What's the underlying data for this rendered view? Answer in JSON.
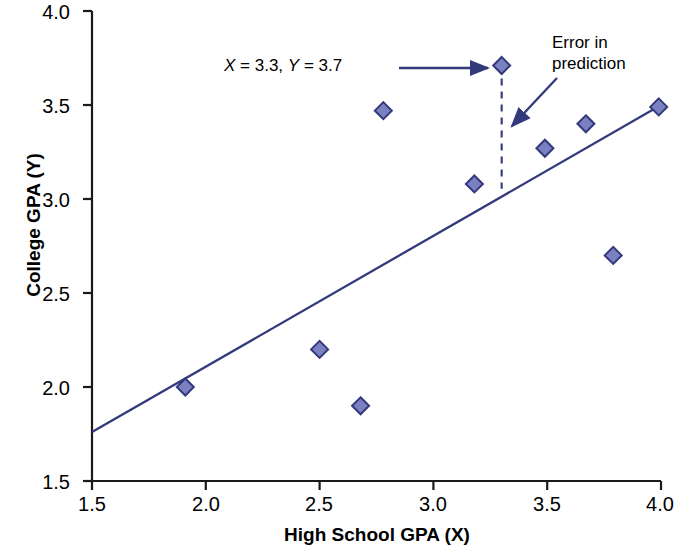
{
  "chart_data": {
    "type": "scatter",
    "title": "",
    "xlabel": "High School GPA (X)",
    "ylabel": "College GPA (Y)",
    "xlim": [
      1.5,
      4.0
    ],
    "ylim": [
      1.5,
      4.0
    ],
    "xticks": [
      "1.5",
      "2.0",
      "2.5",
      "3.0",
      "3.5",
      "4.0"
    ],
    "xtick_values": [
      1.5,
      2.0,
      2.5,
      3.0,
      3.5,
      4.0
    ],
    "yticks": [
      "1.5",
      "2.0",
      "2.5",
      "3.0",
      "3.5",
      "4.0"
    ],
    "ytick_values": [
      1.5,
      2.0,
      2.5,
      3.0,
      3.5,
      4.0
    ],
    "grid": false,
    "legend": false,
    "series": [
      {
        "name": "Students",
        "marker": "diamond",
        "marker_fill": "#7b80c0",
        "marker_edge": "#333a7c",
        "points": [
          {
            "x": 1.91,
            "y": 2.0
          },
          {
            "x": 2.5,
            "y": 2.2
          },
          {
            "x": 2.68,
            "y": 1.9
          },
          {
            "x": 2.78,
            "y": 3.47
          },
          {
            "x": 3.18,
            "y": 3.08
          },
          {
            "x": 3.3,
            "y": 3.71
          },
          {
            "x": 3.49,
            "y": 3.27
          },
          {
            "x": 3.67,
            "y": 3.4
          },
          {
            "x": 3.79,
            "y": 2.7
          },
          {
            "x": 3.99,
            "y": 3.49
          }
        ]
      }
    ],
    "regression_line": {
      "name": "Regression line",
      "color": "#333a7c",
      "x0": 1.5,
      "y0": 1.76,
      "x1": 4.0,
      "y1": 3.5
    },
    "residual_line": {
      "name": "Error in prediction",
      "style": "dashed",
      "color": "#333a7c",
      "x": 3.3,
      "y_top": 3.71,
      "y_bottom": 3.055
    },
    "annotations": [
      {
        "name": "point-coordinates",
        "text_parts": {
          "x_label": "X",
          "x_value": "= 3.3,",
          "y_label": "Y",
          "y_value": "= 3.7"
        },
        "text": "X = 3.3, Y = 3.7",
        "arrow": "horizontal-right",
        "target": {
          "x": 3.3,
          "y": 3.71
        }
      },
      {
        "name": "error-in-prediction",
        "text_line1": "Error in",
        "text_line2": "prediction",
        "text": "Error in prediction",
        "arrow": "diagonal-down-left",
        "target": {
          "x": 3.3,
          "y": 3.45
        }
      }
    ],
    "axis_color": "#000000",
    "marker_size_px": 17
  }
}
